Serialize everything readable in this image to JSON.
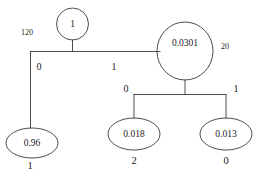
{
  "diagram": {
    "type": "decision-tree",
    "title": "",
    "stroke_color": "#3a3a3a",
    "text_color": "#1a1a1a",
    "background_color": "#ffffff",
    "nodes": [
      {
        "id": "root",
        "label": "1",
        "shape": "circle",
        "cx": 72.5,
        "cy": 24,
        "rx": 16,
        "ry": 16,
        "side_label": "120",
        "side_label_x": 27,
        "side_label_y": 33
      },
      {
        "id": "right-internal",
        "label": "0.0301",
        "shape": "ellipse",
        "cx": 185,
        "cy": 51,
        "rx": 28,
        "ry": 29,
        "side_label": "20",
        "side_label_x": 225,
        "side_label_y": 47
      },
      {
        "id": "leaf-left",
        "label": "0.96",
        "shape": "ellipse",
        "cx": 32,
        "cy": 143,
        "rx": 26,
        "ry": 15,
        "below_label": "1",
        "below_label_x": 30,
        "below_label_y": 167
      },
      {
        "id": "leaf-middle",
        "label": "0.018",
        "shape": "ellipse",
        "cx": 134,
        "cy": 134,
        "rx": 26,
        "ry": 16,
        "below_label": "2",
        "below_label_x": 134,
        "below_label_y": 162
      },
      {
        "id": "leaf-right",
        "label": "0.013",
        "shape": "ellipse",
        "cx": 226,
        "cy": 134,
        "rx": 26,
        "ry": 16,
        "below_label": "0",
        "below_label_x": 226,
        "below_label_y": 162
      }
    ],
    "edges": [
      {
        "id": "root-to-leaf-left",
        "from": "root",
        "to": "leaf-left",
        "label": "0",
        "label_x": 39,
        "label_y": 68
      },
      {
        "id": "root-to-right-internal",
        "from": "root",
        "to": "right-internal",
        "label": "1",
        "label_x": 114,
        "label_y": 68
      },
      {
        "id": "internal-to-leaf-middle",
        "from": "right-internal",
        "to": "leaf-middle",
        "label": "0",
        "label_x": 126,
        "label_y": 90
      },
      {
        "id": "internal-to-leaf-right",
        "from": "right-internal",
        "to": "leaf-right",
        "label": "1",
        "label_x": 236,
        "label_y": 90
      }
    ]
  }
}
